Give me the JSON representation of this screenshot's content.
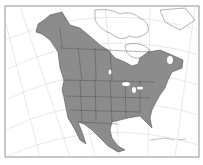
{
  "map": {
    "title": "North America range map",
    "region": "North America",
    "colors": {
      "range_fill": "#8c8c8c",
      "land_outline": "#555555",
      "graticule": "#d8d8d8",
      "frame": "#777777",
      "background": "#ffffff"
    },
    "shaded_regions": [
      "Alaska",
      "Canada (southern & western)",
      "Contiguous United States",
      "Mexico"
    ]
  }
}
